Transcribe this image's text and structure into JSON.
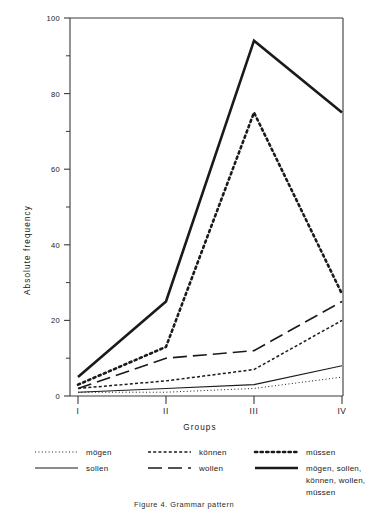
{
  "figure": {
    "caption": "Figure 4.  Grammar pattern"
  },
  "chart_data": {
    "type": "line",
    "title": "",
    "xlabel": "Groups",
    "ylabel": "Absolute frequency",
    "categories": [
      "I",
      "II",
      "III",
      "IV"
    ],
    "ylim": [
      0,
      100
    ],
    "yticks": [
      0,
      20,
      40,
      60,
      80,
      100
    ],
    "yticks_minor": [
      10,
      30,
      50,
      70,
      90
    ],
    "grid": false,
    "legend_position": "below",
    "series": [
      {
        "name": "mögen",
        "style": "fine-dotted",
        "values": [
          1,
          1,
          2,
          5
        ]
      },
      {
        "name": "sollen",
        "style": "thin-solid",
        "values": [
          1,
          2,
          3,
          8
        ]
      },
      {
        "name": "können",
        "style": "dash-dot",
        "values": [
          2,
          4,
          7,
          20
        ]
      },
      {
        "name": "wollen",
        "style": "long-dashed",
        "values": [
          2,
          10,
          12,
          25
        ]
      },
      {
        "name": "müssen",
        "style": "bold-dotted",
        "values": [
          3,
          13,
          75,
          27
        ]
      },
      {
        "name": "mögen, sollen, können, wollen, müssen",
        "style": "bold-solid",
        "values": [
          5,
          25,
          94,
          75
        ]
      }
    ]
  },
  "legend": {
    "entries": [
      {
        "label": "mögen",
        "sample": "fine-dotted"
      },
      {
        "label": "können",
        "sample": "dash-dot"
      },
      {
        "label": "müssen",
        "sample": "bold-dotted"
      },
      {
        "label": "sollen",
        "sample": "thin-solid"
      },
      {
        "label": "wollen",
        "sample": "long-dashed"
      },
      {
        "label": "mögen, sollen,",
        "sample": "bold-solid"
      },
      {
        "label": "können, wollen,",
        "sample": ""
      },
      {
        "label": "müssen",
        "sample": ""
      }
    ]
  }
}
